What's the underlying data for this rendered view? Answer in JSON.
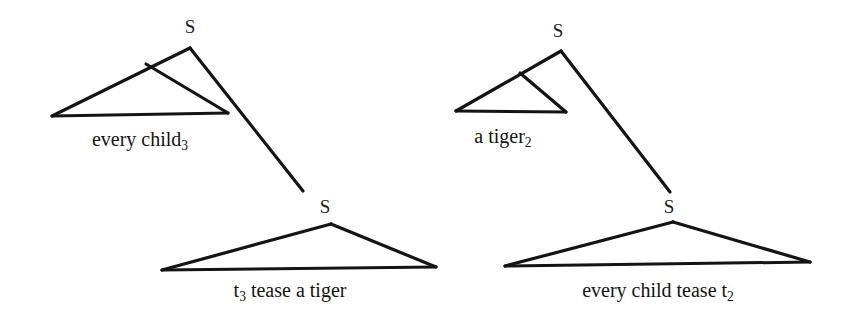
{
  "figure": {
    "background_color": "#ffffff",
    "ink_color": "#141414",
    "width": 850,
    "height": 318
  },
  "derivations": [
    {
      "id": "left-derivation",
      "upper": {
        "root_label": "S",
        "root_label_pos": {
          "x": 190,
          "y": 26
        },
        "apex": {
          "x": 190,
          "y": 48
        },
        "branch_point": {
          "x": 146,
          "y": 64
        },
        "base_left": {
          "x": 52,
          "y": 116
        },
        "base_right": {
          "x": 228,
          "y": 113
        },
        "phrase_text": "every child",
        "phrase_subscript": "3",
        "phrase_pos": {
          "x": 140,
          "y": 139
        }
      },
      "movement_line": {
        "from": {
          "x": 190,
          "y": 48
        },
        "to": {
          "x": 303,
          "y": 191
        }
      },
      "lower": {
        "root_label": "S",
        "root_label_pos": {
          "x": 325,
          "y": 206
        },
        "apex": {
          "x": 331,
          "y": 224
        },
        "base_left": {
          "x": 162,
          "y": 270
        },
        "base_right": {
          "x": 436,
          "y": 267
        },
        "phrase_text_before": "t",
        "phrase_subscript": "3",
        "phrase_text_after": " tease a tiger",
        "phrase_pos": {
          "x": 290,
          "y": 290
        }
      }
    },
    {
      "id": "right-derivation",
      "upper": {
        "root_label": "S",
        "root_label_pos": {
          "x": 558,
          "y": 30
        },
        "apex": {
          "x": 561,
          "y": 51
        },
        "branch_point": {
          "x": 520,
          "y": 73
        },
        "base_left": {
          "x": 456,
          "y": 111
        },
        "base_right": {
          "x": 566,
          "y": 112
        },
        "phrase_text": "a tiger",
        "phrase_subscript": "2",
        "phrase_pos": {
          "x": 503,
          "y": 136
        }
      },
      "movement_line": {
        "from": {
          "x": 561,
          "y": 51
        },
        "to": {
          "x": 670,
          "y": 192
        }
      },
      "lower": {
        "root_label": "S",
        "root_label_pos": {
          "x": 669,
          "y": 206
        },
        "apex": {
          "x": 673,
          "y": 222
        },
        "base_left": {
          "x": 505,
          "y": 266
        },
        "base_right": {
          "x": 810,
          "y": 262
        },
        "phrase_text_before": "every child tease t",
        "phrase_subscript": "2",
        "phrase_text_after": "",
        "phrase_pos": {
          "x": 658,
          "y": 290
        }
      }
    }
  ]
}
